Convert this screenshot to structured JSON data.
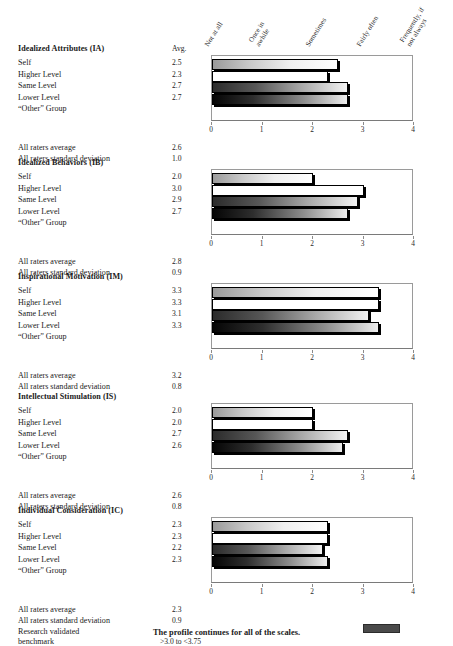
{
  "scale_headers": [
    {
      "label": "Not at all",
      "value": 0
    },
    {
      "label": "Once in\nawhile",
      "value": 1
    },
    {
      "label": "Sometimes",
      "value": 2
    },
    {
      "label": "Fairly often",
      "value": 3
    },
    {
      "label": "Frequently, if\nnot always",
      "value": 4
    }
  ],
  "avg_header": "Avg.",
  "row_labels": [
    "Self",
    "Higher Level",
    "Same Level",
    "Lower Level",
    "“Other” Group"
  ],
  "stat_labels": {
    "average": "All raters average",
    "std_dev": "All raters standard deviation",
    "benchmark_line1": "Research validated",
    "benchmark_line2": "benchmark"
  },
  "axis": {
    "ticks": [
      "0",
      "1",
      "2",
      "3",
      "4"
    ],
    "min": 0,
    "max": 4
  },
  "benchmark": {
    "text": ">3.0 to <3.75",
    "start": 3.0,
    "end": 3.75,
    "color": "#4a4a4a"
  },
  "caption": "The profile continues for all of the scales.",
  "chart_data": [
    {
      "type": "bar",
      "title": "Idealized Attributes (IA)",
      "orientation": "horizontal",
      "categories": [
        "Self",
        "Higher Level",
        "Same Level",
        "Lower Level",
        "“Other” Group"
      ],
      "values": [
        2.5,
        2.3,
        2.7,
        2.7,
        null
      ],
      "value_labels": [
        "2.5",
        "2.3",
        "2.7",
        "2.7",
        ""
      ],
      "xlabel": "",
      "ylabel": "",
      "xlim": [
        0,
        4
      ],
      "xticks": [
        0,
        1,
        2,
        3,
        4
      ],
      "grid": false,
      "all_raters_average": "2.6",
      "all_raters_std_dev": "1.0"
    },
    {
      "type": "bar",
      "title": "Idealized Behaviors (IB)",
      "orientation": "horizontal",
      "categories": [
        "Self",
        "Higher Level",
        "Same Level",
        "Lower Level",
        "“Other” Group"
      ],
      "values": [
        2.0,
        3.0,
        2.9,
        2.7,
        null
      ],
      "value_labels": [
        "2.0",
        "3.0",
        "2.9",
        "2.7",
        ""
      ],
      "xlabel": "",
      "ylabel": "",
      "xlim": [
        0,
        4
      ],
      "xticks": [
        0,
        1,
        2,
        3,
        4
      ],
      "grid": false,
      "all_raters_average": "2.8",
      "all_raters_std_dev": "0.9"
    },
    {
      "type": "bar",
      "title": "Inspirational Motivation (IM)",
      "orientation": "horizontal",
      "categories": [
        "Self",
        "Higher Level",
        "Same Level",
        "Lower Level",
        "“Other” Group"
      ],
      "values": [
        3.3,
        3.3,
        3.1,
        3.3,
        null
      ],
      "value_labels": [
        "3.3",
        "3.3",
        "3.1",
        "3.3",
        ""
      ],
      "xlabel": "",
      "ylabel": "",
      "xlim": [
        0,
        4
      ],
      "xticks": [
        0,
        1,
        2,
        3,
        4
      ],
      "grid": false,
      "all_raters_average": "3.2",
      "all_raters_std_dev": "0.8"
    },
    {
      "type": "bar",
      "title": "Intellectual Stimulation (IS)",
      "orientation": "horizontal",
      "categories": [
        "Self",
        "Higher Level",
        "Same Level",
        "Lower Level",
        "“Other” Group"
      ],
      "values": [
        2.0,
        2.0,
        2.7,
        2.6,
        null
      ],
      "value_labels": [
        "2.0",
        "2.0",
        "2.7",
        "2.6",
        ""
      ],
      "xlabel": "",
      "ylabel": "",
      "xlim": [
        0,
        4
      ],
      "xticks": [
        0,
        1,
        2,
        3,
        4
      ],
      "grid": false,
      "all_raters_average": "2.6",
      "all_raters_std_dev": "0.8"
    },
    {
      "type": "bar",
      "title": "Individual Consideration (IC)",
      "orientation": "horizontal",
      "categories": [
        "Self",
        "Higher Level",
        "Same Level",
        "Lower Level",
        "“Other” Group"
      ],
      "values": [
        2.3,
        2.3,
        2.2,
        2.3,
        null
      ],
      "value_labels": [
        "2.3",
        "2.3",
        "2.2",
        "2.3",
        ""
      ],
      "xlabel": "",
      "ylabel": "",
      "xlim": [
        0,
        4
      ],
      "xticks": [
        0,
        1,
        2,
        3,
        4
      ],
      "grid": false,
      "all_raters_average": "2.3",
      "all_raters_std_dev": "0.9"
    }
  ]
}
